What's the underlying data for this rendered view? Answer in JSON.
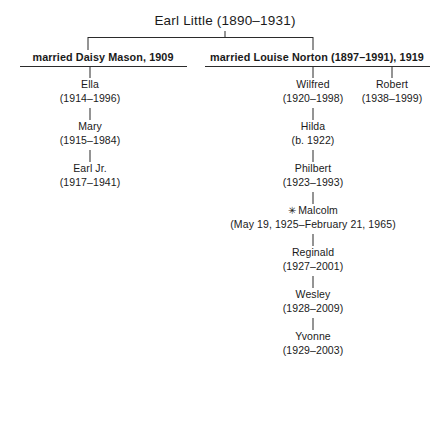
{
  "diagram": {
    "title": "Earl Little (1890–1931)",
    "star_glyph": "✳",
    "line_color": "#2b2b2b"
  },
  "root": {
    "label": "Earl Little (1890–1931)"
  },
  "marriages": [
    {
      "label": "married Daisy Mason, 1909"
    },
    {
      "label": "married Louise Norton (1897–1991), 1919"
    }
  ],
  "left_children": [
    {
      "name": "Ella",
      "dates": "(1914–1996)"
    },
    {
      "name": "Mary",
      "dates": "(1915–1984)"
    },
    {
      "name": "Earl Jr.",
      "dates": "(1917–1941)"
    }
  ],
  "right_children": [
    {
      "name": "Wilfred",
      "dates": "(1920–1998)"
    },
    {
      "name": "Hilda",
      "dates": "(b. 1922)"
    },
    {
      "name": "Philbert",
      "dates": "(1923–1993)"
    },
    {
      "name": "Malcolm",
      "dates": "(May 19, 1925–February 21, 1965)",
      "starred": true
    },
    {
      "name": "Reginald",
      "dates": "(1927–2001)"
    },
    {
      "name": "Wesley",
      "dates": "(1928–2009)"
    },
    {
      "name": "Yvonne",
      "dates": "(1929–2003)"
    }
  ],
  "far_right_children": [
    {
      "name": "Robert",
      "dates": "(1938–1999)"
    }
  ]
}
